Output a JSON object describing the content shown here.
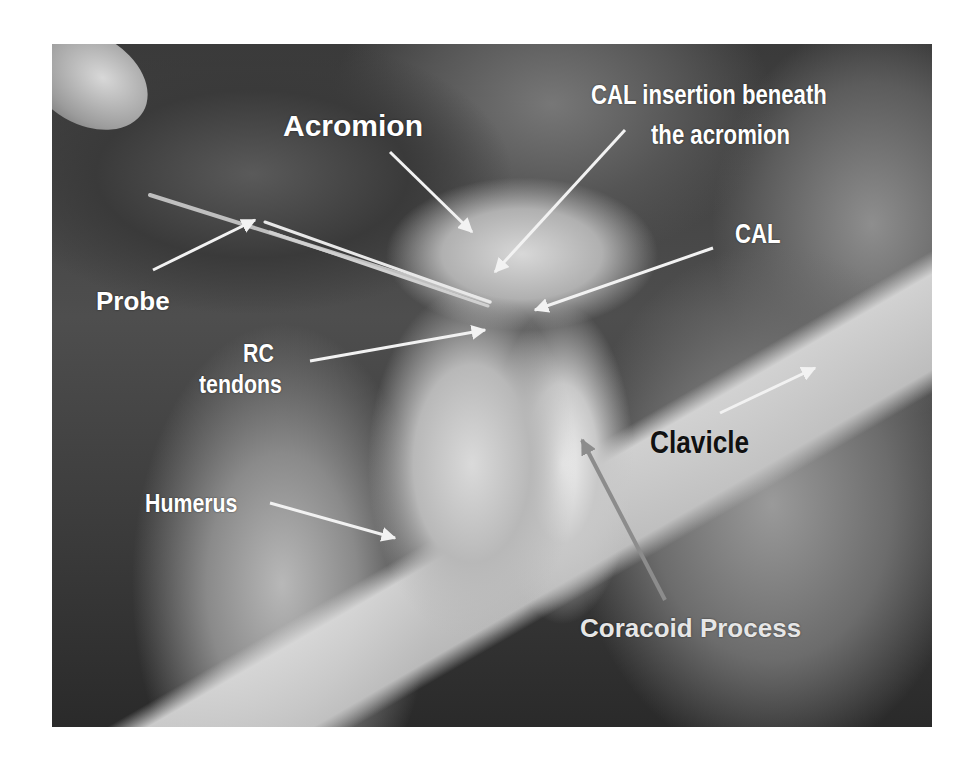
{
  "figure": {
    "labels": {
      "acromion": "Acromion",
      "cal_insertion_line1": "CAL insertion beneath",
      "cal_insertion_line2": "the acromion",
      "cal": "CAL",
      "probe": "Probe",
      "rc_line1": "RC",
      "rc_line2": "tendons",
      "clavicle": "Clavicle",
      "humerus": "Humerus",
      "coracoid": "Coracoid Process"
    },
    "colors": {
      "label_text": "#ffffff",
      "clavicle_text": "#111111",
      "arrow": "#f2f2f2",
      "coracoid_arrow": "#8c8c8c",
      "background": "#ffffff"
    }
  }
}
